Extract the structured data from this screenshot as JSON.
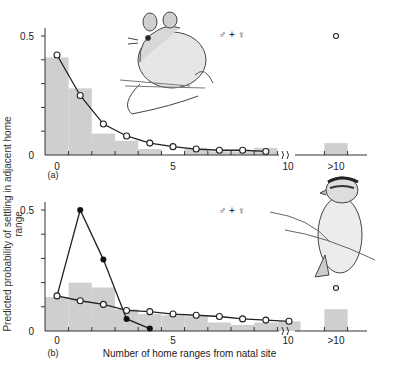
{
  "figure": {
    "ylabel": "Predicted probability of settling in adjacent home range",
    "xlabel": "Number of home ranges from natal site",
    "sex_label": "♂ + ♀"
  },
  "chart_data": [
    {
      "type": "bar+line",
      "panel": "(a)",
      "subject": "mouse illustration",
      "annotation": "♂ + ♀",
      "categories": [
        "0",
        "1",
        "2",
        "3",
        "4",
        "5",
        "6",
        "7",
        "8",
        "9",
        "10",
        ">10"
      ],
      "x_tick_labels": [
        "0",
        "5",
        "10",
        ">10"
      ],
      "y_tick_labels": [
        "0",
        "0.5"
      ],
      "ylim": [
        0,
        0.5
      ],
      "observed_histogram": [
        0.41,
        0.28,
        0.09,
        0.06,
        0.025,
        0.0,
        0.03,
        0.015,
        0.015,
        0.03,
        0.0,
        0.05
      ],
      "series": [
        {
          "name": "predicted (open circles)",
          "marker": "open-circle",
          "x": [
            0,
            1,
            2,
            3,
            4,
            5,
            6,
            7,
            8,
            9
          ],
          "values": [
            0.42,
            0.25,
            0.13,
            0.08,
            0.05,
            0.035,
            0.025,
            0.02,
            0.02,
            0.015
          ],
          "gt10": 0.5
        }
      ],
      "axis_break": "between 10 and >10"
    },
    {
      "type": "bar+line",
      "panel": "(b)",
      "subject": "bird illustration",
      "annotation": "♂ + ♀",
      "categories": [
        "0",
        "1",
        "2",
        "3",
        "4",
        "5",
        "6",
        "7",
        "8",
        "9",
        "10",
        ">10"
      ],
      "x_tick_labels": [
        "0",
        "5",
        "10",
        ">10"
      ],
      "y_tick_labels": [
        "0",
        "0.5"
      ],
      "ylim": [
        0,
        0.5
      ],
      "observed_histogram": [
        0.14,
        0.2,
        0.18,
        0.09,
        0.07,
        0.065,
        0.06,
        0.035,
        0.025,
        0.035,
        0.04,
        0.09
      ],
      "series": [
        {
          "name": "predicted (filled circles)",
          "marker": "filled-circle",
          "x": [
            0,
            1,
            2,
            3,
            4
          ],
          "values": [
            0.145,
            0.5,
            0.295,
            0.05,
            0.01
          ]
        },
        {
          "name": "predicted (open circles)",
          "marker": "open-circle",
          "x": [
            0,
            1,
            2,
            3,
            4,
            5,
            6,
            7,
            8,
            9,
            10
          ],
          "values": [
            0.145,
            0.125,
            0.11,
            0.085,
            0.08,
            0.07,
            0.065,
            0.06,
            0.05,
            0.045,
            0.04
          ],
          "gt10": 0.06
        }
      ],
      "axis_break": "between 10 and >10"
    }
  ]
}
